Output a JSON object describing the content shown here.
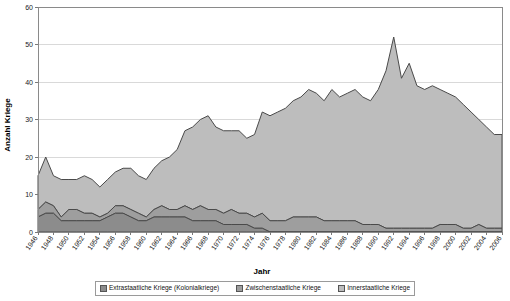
{
  "chart_data": {
    "type": "area",
    "stacked": true,
    "title": "",
    "xlabel": "Jahr",
    "ylabel": "Anzahl Kriege",
    "ylim": [
      0,
      60
    ],
    "ytick_step": 10,
    "yticks": [
      0,
      10,
      20,
      30,
      40,
      50,
      60
    ],
    "grid": true,
    "grid_axis": "y",
    "legend_position": "bottom",
    "x": [
      1946,
      1947,
      1948,
      1949,
      1950,
      1951,
      1952,
      1953,
      1954,
      1955,
      1956,
      1957,
      1958,
      1959,
      1960,
      1961,
      1962,
      1963,
      1964,
      1965,
      1966,
      1967,
      1968,
      1969,
      1970,
      1971,
      1972,
      1973,
      1974,
      1975,
      1976,
      1977,
      1978,
      1979,
      1980,
      1981,
      1982,
      1983,
      1984,
      1985,
      1986,
      1987,
      1988,
      1989,
      1990,
      1991,
      1992,
      1993,
      1994,
      1995,
      1996,
      1997,
      1998,
      1999,
      2000,
      2001,
      2002,
      2003,
      2004,
      2005,
      2006
    ],
    "xtick_labels": [
      "1946",
      "1948",
      "1950",
      "1952",
      "1954",
      "1956",
      "1958",
      "1960",
      "1962",
      "1964",
      "1966",
      "1968",
      "1970",
      "1972",
      "1974",
      "1976",
      "1978",
      "1980",
      "1982",
      "1984",
      "1986",
      "1988",
      "1990",
      "1992",
      "1994",
      "1996",
      "1998",
      "2000",
      "2002",
      "2004",
      "2006"
    ],
    "series": [
      {
        "name": "Extrastaatliche Kriege (Kolonialkriege)",
        "color": "#8c8c8c",
        "values": [
          4,
          5,
          5,
          3,
          3,
          3,
          3,
          3,
          3,
          4,
          5,
          5,
          4,
          3,
          3,
          4,
          4,
          4,
          4,
          4,
          3,
          3,
          3,
          3,
          2,
          2,
          2,
          2,
          1,
          1,
          0,
          0,
          0,
          0,
          0,
          0,
          0,
          0,
          0,
          0,
          0,
          0,
          0,
          0,
          0,
          0,
          0,
          0,
          0,
          0,
          0,
          0,
          0,
          0,
          0,
          0,
          0,
          0,
          0,
          0,
          0
        ]
      },
      {
        "name": "Zwischenstaatliche Kriege",
        "color": "#9e9e9e",
        "values": [
          2,
          3,
          2,
          1,
          3,
          3,
          2,
          2,
          1,
          1,
          2,
          2,
          2,
          2,
          1,
          2,
          3,
          2,
          2,
          3,
          3,
          4,
          3,
          3,
          3,
          4,
          3,
          3,
          3,
          4,
          3,
          3,
          3,
          4,
          4,
          4,
          4,
          3,
          3,
          3,
          3,
          3,
          2,
          2,
          2,
          1,
          1,
          1,
          1,
          1,
          1,
          1,
          2,
          2,
          2,
          1,
          1,
          2,
          1,
          1,
          1
        ]
      },
      {
        "name": "Innerstaatliche Kriege",
        "color": "#bdbdbd",
        "values": [
          9,
          12,
          8,
          10,
          8,
          8,
          10,
          9,
          8,
          9,
          9,
          10,
          11,
          10,
          10,
          11,
          12,
          14,
          16,
          20,
          22,
          23,
          25,
          22,
          22,
          21,
          22,
          20,
          22,
          27,
          28,
          29,
          30,
          31,
          32,
          34,
          33,
          32,
          35,
          33,
          34,
          35,
          34,
          33,
          36,
          42,
          51,
          40,
          44,
          38,
          37,
          38,
          36,
          35,
          34,
          33,
          31,
          28,
          27,
          25,
          25
        ]
      }
    ]
  },
  "legend": {
    "items": [
      {
        "label": "Extrastaatliche Kriege (Kolonialkriege)",
        "swatch": "#8c8c8c"
      },
      {
        "label": "Zwischenstaatliche Kriege",
        "swatch": "#9e9e9e"
      },
      {
        "label": "Innerstaatliche Kriege",
        "swatch": "#bdbdbd"
      }
    ]
  }
}
